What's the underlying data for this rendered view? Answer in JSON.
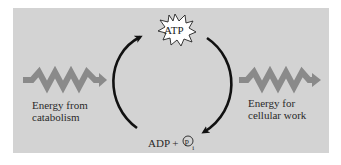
{
  "diagram": {
    "nodes": {
      "top": {
        "label": "ATP",
        "shape": "starburst"
      },
      "bottom": {
        "label_main": "ADP + ",
        "label_circle": "P",
        "label_sub": "i"
      }
    },
    "inputs": {
      "left": {
        "line1": "Energy from",
        "line2": "catabolism",
        "icon": "zigzag-arrow-right"
      }
    },
    "outputs": {
      "right": {
        "line1": "Energy for",
        "line2": "cellular work",
        "icon": "zigzag-arrow-right"
      }
    },
    "arrows": [
      {
        "from": "ADP + Pi",
        "to": "ATP",
        "side": "left"
      },
      {
        "from": "ATP",
        "to": "ADP + Pi",
        "side": "right"
      }
    ],
    "colors": {
      "panel": "#d3d3d3",
      "zigzag": "#8a8a8a",
      "arrow": "#111111",
      "text": "#2a2a2a",
      "starburst_fill": "#ffffff"
    }
  }
}
